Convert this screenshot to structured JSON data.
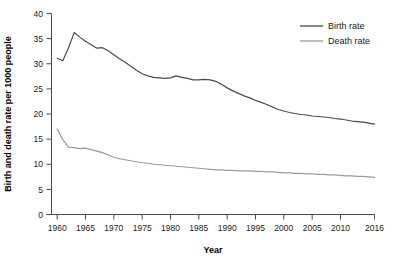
{
  "chart_data": {
    "type": "line",
    "title": "",
    "xlabel": "Year",
    "ylabel": "Birth and death rate per 1000 people",
    "xlim": [
      1959,
      2016
    ],
    "ylim": [
      0,
      40
    ],
    "xticks": [
      1960,
      1965,
      1970,
      1975,
      1980,
      1985,
      1990,
      1995,
      2000,
      2005,
      2010,
      2016
    ],
    "xtick_labels": [
      "1960",
      "1965",
      "1970",
      "1975",
      "1980",
      "1985",
      "1990",
      "1995",
      "2000",
      "2005",
      "2010",
      "2016"
    ],
    "yticks": [
      0,
      5,
      10,
      15,
      20,
      25,
      30,
      35,
      40
    ],
    "ytick_labels": [
      "0",
      "5",
      "10",
      "15",
      "20",
      "25",
      "30",
      "35",
      "40"
    ],
    "grid": false,
    "legend_position": "top-right",
    "x": [
      1960,
      1961,
      1962,
      1963,
      1964,
      1965,
      1966,
      1967,
      1968,
      1969,
      1970,
      1971,
      1972,
      1973,
      1974,
      1975,
      1976,
      1977,
      1978,
      1979,
      1980,
      1981,
      1982,
      1983,
      1984,
      1985,
      1986,
      1987,
      1988,
      1989,
      1990,
      1991,
      1992,
      1993,
      1994,
      1995,
      1996,
      1997,
      1998,
      1999,
      2000,
      2001,
      2002,
      2003,
      2004,
      2005,
      2006,
      2007,
      2008,
      2009,
      2010,
      2011,
      2012,
      2013,
      2014,
      2015,
      2016
    ],
    "series": [
      {
        "name": "Birth rate",
        "color": "#4a4a4a",
        "values": [
          31.1,
          30.6,
          33.2,
          36.2,
          35.3,
          34.5,
          33.8,
          33.1,
          33.2,
          32.6,
          31.8,
          31.0,
          30.3,
          29.5,
          28.7,
          28.0,
          27.6,
          27.3,
          27.2,
          27.1,
          27.2,
          27.6,
          27.3,
          27.1,
          26.8,
          26.8,
          26.9,
          26.8,
          26.5,
          25.9,
          25.2,
          24.6,
          24.1,
          23.6,
          23.2,
          22.7,
          22.3,
          21.9,
          21.4,
          20.9,
          20.6,
          20.3,
          20.1,
          19.9,
          19.8,
          19.6,
          19.5,
          19.4,
          19.3,
          19.1,
          19.0,
          18.8,
          18.6,
          18.5,
          18.4,
          18.2,
          18.0
        ]
      },
      {
        "name": "Death rate",
        "color": "#9a9a9a",
        "values": [
          17.0,
          14.9,
          13.4,
          13.3,
          13.1,
          13.2,
          12.9,
          12.6,
          12.3,
          11.9,
          11.4,
          11.1,
          10.9,
          10.7,
          10.5,
          10.3,
          10.2,
          10.0,
          9.9,
          9.8,
          9.7,
          9.6,
          9.5,
          9.4,
          9.3,
          9.2,
          9.1,
          9.0,
          8.9,
          8.9,
          8.8,
          8.8,
          8.7,
          8.7,
          8.7,
          8.6,
          8.6,
          8.5,
          8.5,
          8.4,
          8.3,
          8.3,
          8.2,
          8.2,
          8.1,
          8.1,
          8.0,
          8.0,
          7.9,
          7.9,
          7.8,
          7.7,
          7.7,
          7.6,
          7.6,
          7.5,
          7.4
        ]
      }
    ],
    "legend": [
      {
        "label": "Birth rate",
        "color": "#4a4a4a"
      },
      {
        "label": "Death rate",
        "color": "#9a9a9a"
      }
    ]
  }
}
